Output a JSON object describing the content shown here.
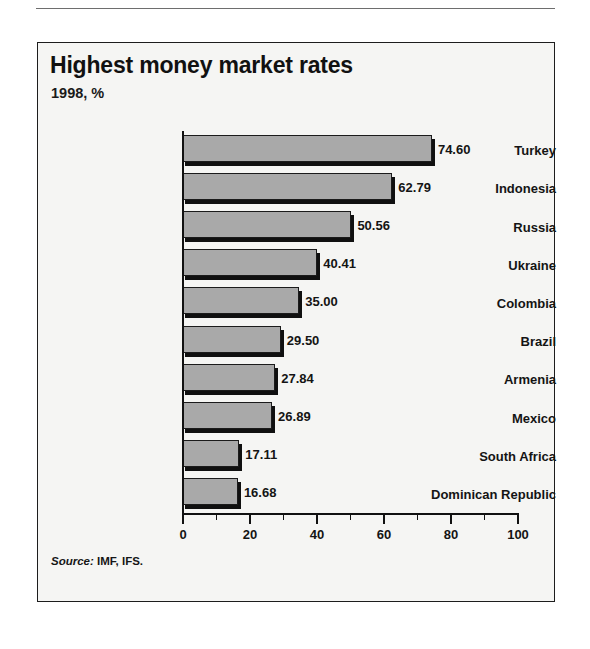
{
  "figure": {
    "title": "Highest money market rates",
    "subtitle": "1998, %",
    "source_lead": "Source:",
    "source_text": " IMF, IFS."
  },
  "axis": {
    "tick_labels": [
      "0",
      "20",
      "40",
      "60",
      "80",
      "100"
    ]
  },
  "chart_data": {
    "type": "bar",
    "orientation": "horizontal",
    "title": "Highest money market rates",
    "subtitle": "1998, %",
    "xlabel": "",
    "ylabel": "",
    "xlim": [
      0,
      100
    ],
    "xticks": [
      0,
      20,
      40,
      60,
      80,
      100
    ],
    "minor_tick_interval": 10,
    "grid": false,
    "legend": false,
    "value_label_format": "2 decimals",
    "bar_color": "#a9a9a9",
    "bar_edge_color": "#1b1b1b",
    "shadow_color": "#101010",
    "categories": [
      "Turkey",
      "Indonesia",
      "Russia",
      "Ukraine",
      "Colombia",
      "Brazil",
      "Armenia",
      "Mexico",
      "South Africa",
      "Dominican Republic"
    ],
    "values": [
      74.6,
      62.79,
      50.56,
      40.41,
      35.0,
      29.5,
      27.84,
      26.89,
      17.11,
      16.68
    ],
    "value_labels": [
      "74.60",
      "62.79",
      "50.56",
      "40.41",
      "35.00",
      "29.50",
      "27.84",
      "26.89",
      "17.11",
      "16.68"
    ],
    "source": "Source: IMF, IFS."
  }
}
